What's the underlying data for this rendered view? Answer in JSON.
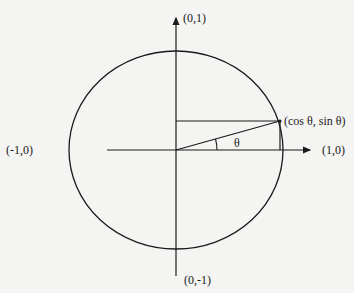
{
  "diagram": {
    "type": "unit-circle",
    "colors": {
      "background": "#f4f4f2",
      "stroke": "#1a1a1a"
    },
    "labels": {
      "top": "(0,1)",
      "bottom": "(0,-1)",
      "left": "(-1,0)",
      "right": "(1,0)",
      "point": "(cos θ, sin θ)",
      "angle": "θ"
    },
    "geometry": {
      "center": [
        176,
        150
      ],
      "radius_x": 107,
      "radius_y": 99,
      "point_on_circle": [
        280,
        121
      ],
      "x_axis": [
        107,
        314
      ],
      "y_axis": [
        14,
        276
      ]
    }
  }
}
